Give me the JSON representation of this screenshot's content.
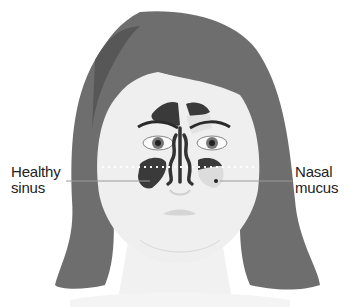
{
  "diagram": {
    "labels": {
      "left": {
        "line1": "Healthy",
        "line2": "sinus"
      },
      "right": {
        "line1": "Nasal",
        "line2": "mucus"
      }
    },
    "colors": {
      "hair": "#6e6e6e",
      "hair_shadow": "#555555",
      "skin": "#efefef",
      "sinus_dark": "#3a3a3a",
      "mucus": "#dcdcdc",
      "leader_line": "#9a9a9a"
    }
  }
}
